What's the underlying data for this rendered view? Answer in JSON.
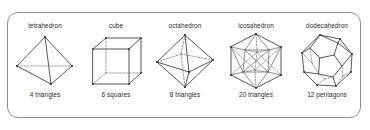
{
  "figure": {
    "frame_style": "rounded-rectangle-border",
    "border_color": "#8f8f8f",
    "background_color": "#fefefe",
    "ink_color": "#3a3a3a",
    "hidden_edge_color": "#767676"
  },
  "solids": [
    {
      "name": "tetrahedron",
      "faces": "4 triangles",
      "icon": "tetrahedron-wireframe-icon"
    },
    {
      "name": "cube",
      "faces": "6 squares",
      "icon": "cube-wireframe-icon"
    },
    {
      "name": "octahedron",
      "faces": "8 triangles",
      "icon": "octahedron-wireframe-icon"
    },
    {
      "name": "icosahedron",
      "faces": "20 triangles",
      "icon": "icosahedron-wireframe-icon"
    },
    {
      "name": "dodecahedron",
      "faces": "12 pentagons",
      "icon": "dodecahedron-wireframe-icon"
    }
  ]
}
